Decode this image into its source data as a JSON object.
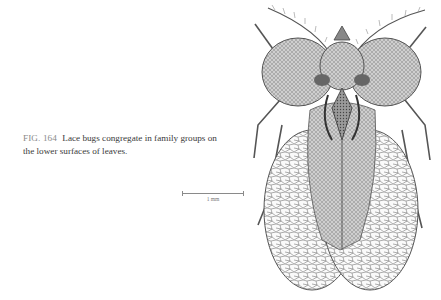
{
  "figure": {
    "number_label": "FIG. 164",
    "caption": "Lace bugs congregate in family groups on the lower surfaces of leaves.",
    "scale_bar_label": "1 mm",
    "illustration": "lace-bug-illustration"
  }
}
